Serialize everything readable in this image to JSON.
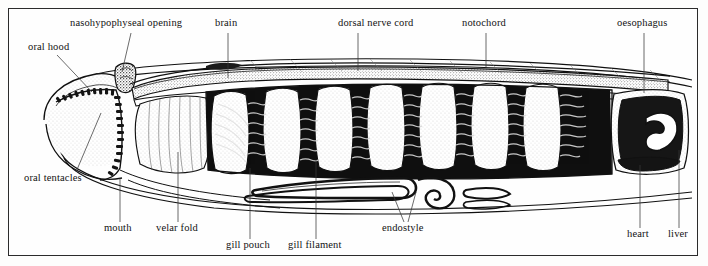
{
  "figure": {
    "style": "black-and-white line engraving / stipple illustration",
    "border_color": "#2b2b2b",
    "ink_color": "#111111",
    "background_color": "#fefefe"
  },
  "labels": [
    {
      "id": "nasohypophyseal-opening",
      "text": "nasohypophyseal opening",
      "x": 70,
      "y": 22,
      "anchor_x": 131,
      "anchor_y": 33,
      "target_x": 122,
      "target_y": 72,
      "side": "top"
    },
    {
      "id": "brain",
      "text": "brain",
      "x": 215,
      "y": 22,
      "anchor_x": 228,
      "anchor_y": 33,
      "target_x": 228,
      "target_y": 78,
      "side": "top"
    },
    {
      "id": "dorsal-nerve-cord",
      "text": "dorsal nerve cord",
      "x": 338,
      "y": 22,
      "anchor_x": 358,
      "anchor_y": 33,
      "target_x": 358,
      "target_y": 71,
      "side": "top"
    },
    {
      "id": "notochord",
      "text": "notochord",
      "x": 462,
      "y": 22,
      "anchor_x": 486,
      "anchor_y": 33,
      "target_x": 486,
      "target_y": 67,
      "side": "top"
    },
    {
      "id": "oesophagus",
      "text": "oesophagus",
      "x": 617,
      "y": 22,
      "anchor_x": 644,
      "anchor_y": 33,
      "target_x": 644,
      "target_y": 93,
      "side": "top"
    },
    {
      "id": "oral-hood",
      "text": "oral hood",
      "x": 28,
      "y": 44,
      "anchor_x": 57,
      "anchor_y": 55,
      "target_x": 92,
      "target_y": 92,
      "side": "left"
    },
    {
      "id": "oral-tentacles",
      "text": "oral tentacles",
      "x": 24,
      "y": 178,
      "anchor_x": 76,
      "anchor_y": 176,
      "target_x": 100,
      "target_y": 115,
      "side": "left"
    },
    {
      "id": "mouth",
      "text": "mouth",
      "x": 104,
      "y": 226,
      "anchor_x": 120,
      "anchor_y": 222,
      "target_x": 120,
      "target_y": 178,
      "side": "bottom"
    },
    {
      "id": "velar-fold",
      "text": "velar fold",
      "x": 156,
      "y": 226,
      "anchor_x": 178,
      "anchor_y": 222,
      "target_x": 178,
      "target_y": 152,
      "side": "bottom"
    },
    {
      "id": "gill-pouch",
      "text": "gill pouch",
      "x": 226,
      "y": 243,
      "anchor_x": 250,
      "anchor_y": 239,
      "target_x": 250,
      "target_y": 168,
      "side": "bottom"
    },
    {
      "id": "gill-filament",
      "text": "gill filament",
      "x": 288,
      "y": 243,
      "anchor_x": 316,
      "anchor_y": 239,
      "target_x": 316,
      "target_y": 160,
      "side": "bottom"
    },
    {
      "id": "endostyle",
      "text": "endostyle",
      "x": 382,
      "y": 226,
      "anchor_x": 404,
      "anchor_y": 222,
      "target_x": 392,
      "target_y": 192,
      "side": "bottom"
    },
    {
      "id": "heart",
      "text": "heart",
      "x": 627,
      "y": 232,
      "anchor_x": 640,
      "anchor_y": 228,
      "target_x": 640,
      "target_y": 165,
      "side": "bottom"
    },
    {
      "id": "liver",
      "text": "liver",
      "x": 668,
      "y": 232,
      "anchor_x": 679,
      "anchor_y": 228,
      "target_x": 679,
      "target_y": 150,
      "side": "bottom"
    }
  ],
  "structures": {
    "pharynx_gill_bar_count": 7,
    "notochord_description": "stippled dorsal rod running the length of the body",
    "nerve_cord_description": "thin dark tube lying immediately above the notochord",
    "endostyle_description": "ventral ciliated groove ending in a coiled spiral",
    "oral_hood_description": "anterior hood fringed with buccal cirri (oral tentacles)"
  }
}
